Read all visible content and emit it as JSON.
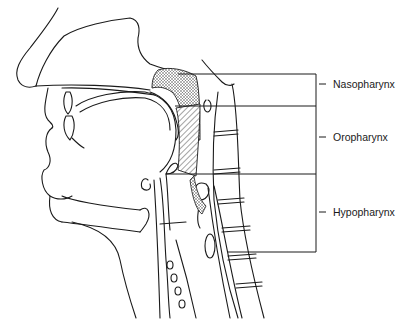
{
  "figure": {
    "regions": [
      {
        "label": "Nasopharynx",
        "top_y": 74,
        "bottom_y": 106,
        "tick_y": 84
      },
      {
        "label": "Oropharynx",
        "top_y": 106,
        "bottom_y": 174,
        "tick_y": 137
      },
      {
        "label": "Hypopharynx",
        "top_y": 174,
        "bottom_y": 252,
        "tick_y": 212
      }
    ],
    "colors": {
      "line": "#1a1a1a",
      "background": "#ffffff",
      "stipple": "#555555"
    }
  }
}
